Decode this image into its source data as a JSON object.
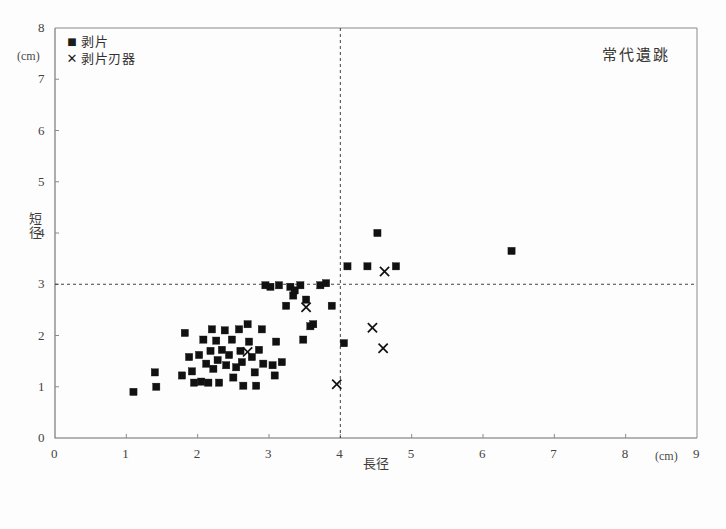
{
  "chart_data": {
    "type": "scatter",
    "title": "常代遺跳",
    "xlabel": "長径",
    "ylabel": "短径",
    "x_unit": "(cm)",
    "y_unit": "(cm)",
    "xlim": [
      0,
      9
    ],
    "ylim": [
      0,
      8
    ],
    "xticks": [
      0,
      1,
      2,
      3,
      4,
      5,
      6,
      7,
      8,
      9
    ],
    "yticks": [
      0,
      1,
      2,
      3,
      4,
      5,
      6,
      7,
      8
    ],
    "grid": false,
    "reference_lines": {
      "vertical_x": 4,
      "horizontal_y": 3,
      "style": "dashed"
    },
    "legend": {
      "position": "top-left-inside",
      "entries": [
        {
          "label": "剥片",
          "marker": "square"
        },
        {
          "label": "剥片刃器",
          "marker": "cross"
        }
      ]
    },
    "series": [
      {
        "name": "剥片",
        "marker": "square",
        "color": "#111111",
        "points": [
          [
            1.1,
            0.9
          ],
          [
            1.42,
            1.0
          ],
          [
            1.4,
            1.28
          ],
          [
            1.78,
            1.22
          ],
          [
            1.82,
            2.05
          ],
          [
            1.88,
            1.58
          ],
          [
            1.92,
            1.3
          ],
          [
            1.95,
            1.08
          ],
          [
            2.02,
            1.62
          ],
          [
            2.05,
            1.1
          ],
          [
            2.08,
            1.92
          ],
          [
            2.12,
            1.45
          ],
          [
            2.15,
            1.08
          ],
          [
            2.18,
            1.7
          ],
          [
            2.2,
            2.12
          ],
          [
            2.22,
            1.35
          ],
          [
            2.26,
            1.9
          ],
          [
            2.28,
            1.52
          ],
          [
            2.3,
            1.08
          ],
          [
            2.34,
            1.72
          ],
          [
            2.38,
            2.1
          ],
          [
            2.4,
            1.42
          ],
          [
            2.44,
            1.62
          ],
          [
            2.48,
            1.92
          ],
          [
            2.5,
            1.18
          ],
          [
            2.54,
            1.38
          ],
          [
            2.58,
            2.12
          ],
          [
            2.6,
            1.7
          ],
          [
            2.62,
            1.48
          ],
          [
            2.64,
            1.02
          ],
          [
            2.7,
            2.22
          ],
          [
            2.72,
            1.88
          ],
          [
            2.76,
            1.58
          ],
          [
            2.8,
            1.28
          ],
          [
            2.82,
            1.02
          ],
          [
            2.86,
            1.72
          ],
          [
            2.9,
            2.12
          ],
          [
            2.92,
            1.45
          ],
          [
            2.95,
            2.98
          ],
          [
            3.02,
            2.95
          ],
          [
            3.05,
            1.42
          ],
          [
            3.08,
            1.22
          ],
          [
            3.1,
            1.88
          ],
          [
            3.14,
            2.98
          ],
          [
            3.18,
            1.48
          ],
          [
            3.24,
            2.58
          ],
          [
            3.3,
            2.95
          ],
          [
            3.34,
            2.78
          ],
          [
            3.36,
            2.88
          ],
          [
            3.44,
            2.98
          ],
          [
            3.48,
            1.92
          ],
          [
            3.52,
            2.7
          ],
          [
            3.58,
            2.18
          ],
          [
            3.62,
            2.22
          ],
          [
            3.72,
            2.98
          ],
          [
            3.8,
            3.02
          ],
          [
            3.88,
            2.58
          ],
          [
            4.05,
            1.85
          ],
          [
            4.1,
            3.35
          ],
          [
            4.38,
            3.35
          ],
          [
            4.52,
            4.0
          ],
          [
            4.78,
            3.35
          ],
          [
            6.4,
            3.65
          ]
        ]
      },
      {
        "name": "剥片刃器",
        "marker": "cross",
        "color": "#111111",
        "points": [
          [
            2.7,
            1.68
          ],
          [
            3.52,
            2.55
          ],
          [
            3.95,
            1.05
          ],
          [
            4.45,
            2.15
          ],
          [
            4.6,
            1.75
          ],
          [
            4.62,
            3.25
          ]
        ]
      }
    ]
  },
  "plot_geometry": {
    "left": 55,
    "right": 697,
    "top": 28,
    "bottom": 438
  }
}
